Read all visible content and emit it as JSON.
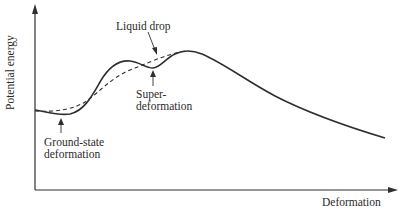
{
  "diagram": {
    "y_axis_label": "Potential energy",
    "x_axis_label": "Deformation",
    "annotations": {
      "liquid_drop": "Liquid drop",
      "super_line1": "Super-",
      "super_line2": "deformation",
      "ground_line1": "Ground-state",
      "ground_line2": "deformation"
    },
    "curves": [
      {
        "name": "Actual potential energy",
        "style": "solid"
      },
      {
        "name": "Liquid drop",
        "style": "dashed"
      }
    ],
    "colors": {
      "line": "#2f2f2f",
      "text": "#2a2a2a",
      "background": "#ffffff"
    }
  }
}
